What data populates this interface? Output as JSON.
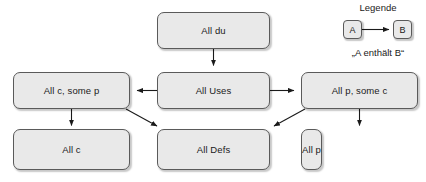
{
  "diagram": {
    "title": "",
    "nodes": [
      {
        "id": "all-du",
        "label": "All du"
      },
      {
        "id": "all-c-some-p",
        "label": "All c, some p"
      },
      {
        "id": "all-uses",
        "label": "All Uses"
      },
      {
        "id": "all-p-some-c",
        "label": "All p, some c"
      },
      {
        "id": "all-c",
        "label": "All c"
      },
      {
        "id": "all-defs",
        "label": "All Defs"
      },
      {
        "id": "all-p",
        "label": "All p"
      }
    ],
    "edges": [
      {
        "from": "all-du",
        "to": "all-uses",
        "style": "arrow-down"
      },
      {
        "from": "all-uses",
        "to": "all-c-some-p",
        "style": "arrow-left"
      },
      {
        "from": "all-uses",
        "to": "all-p-some-c",
        "style": "arrow-right"
      },
      {
        "from": "all-c-some-p",
        "to": "all-c",
        "style": "arrow-down"
      },
      {
        "from": "all-c-some-p",
        "to": "all-defs",
        "style": "arrow-diagonal"
      },
      {
        "from": "all-p-some-c",
        "to": "all-defs",
        "style": "arrow-diagonal"
      },
      {
        "from": "all-p-some-c",
        "to": "all-p",
        "style": "arrow-down"
      }
    ],
    "colors": {
      "node_fill": "#e9e9e9",
      "node_border": "#5a5a5a",
      "edge": "#1a1a1a",
      "text": "#1a1a1a",
      "background": "#ffffff"
    }
  },
  "legend": {
    "title": "Legende",
    "node_a": "A",
    "node_b": "B",
    "caption": "„A enthält B“"
  }
}
